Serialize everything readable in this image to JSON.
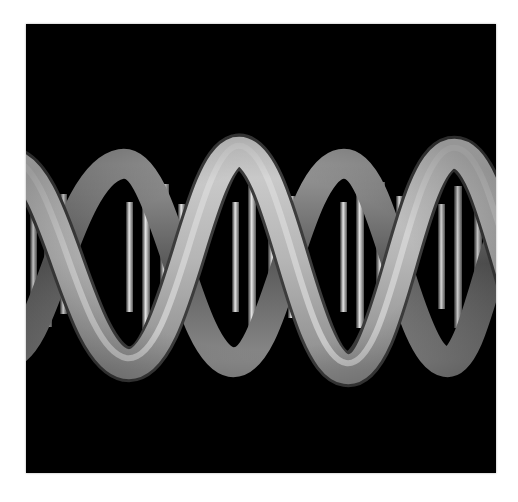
{
  "image": {
    "description": "3D render of a grey DNA double helix on a black background",
    "subject": "DNA double helix",
    "colors": {
      "background": "#000000",
      "page": "#ffffff",
      "strand_light": "#d9d9d9",
      "strand_mid": "#a9a9a9",
      "strand_dark": "#3a3a3a"
    }
  }
}
